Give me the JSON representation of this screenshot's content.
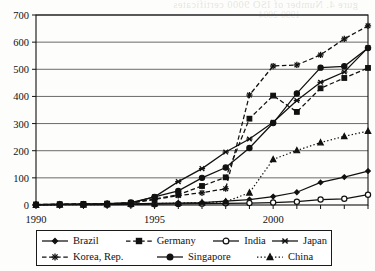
{
  "scan": {
    "bleed_text": "gure 4. Number of ISO 9000 certificates",
    "bleed_text_2": "1990-2004"
  },
  "chart_data": {
    "type": "line",
    "title": "",
    "subtitle": "",
    "xlabel": "",
    "ylabel": "",
    "xlim": [
      1990,
      2004
    ],
    "ylim": [
      0,
      700
    ],
    "ytick_step": 100,
    "yticks": [
      0,
      100,
      200,
      300,
      400,
      500,
      600,
      700
    ],
    "x": [
      1990,
      1991,
      1992,
      1993,
      1994,
      1995,
      1996,
      1997,
      1998,
      1999,
      2000,
      2001,
      2002,
      2003,
      2004
    ],
    "xtick_labels": [
      "1990",
      "1995",
      "2000"
    ],
    "xtick_label_years": [
      1990,
      1995,
      2000
    ],
    "grid": "horizontal",
    "legend_position": "below",
    "series": [
      {
        "name": "Brazil",
        "marker": "diamond",
        "line": "solid",
        "values": [
          1,
          2,
          2,
          3,
          4,
          6,
          7,
          9,
          14,
          20,
          31,
          47,
          83,
          103,
          125
        ]
      },
      {
        "name": "Germany",
        "marker": "square",
        "line": "dashed",
        "values": [
          2,
          3,
          4,
          5,
          8,
          22,
          38,
          70,
          102,
          318,
          403,
          343,
          430,
          468,
          505
        ]
      },
      {
        "name": "India",
        "marker": "circle-open",
        "line": "solid",
        "values": [
          0,
          1,
          1,
          1,
          2,
          3,
          4,
          5,
          6,
          7,
          9,
          12,
          20,
          23,
          38
        ]
      },
      {
        "name": "Japan",
        "marker": "x",
        "line": "solid",
        "values": [
          1,
          2,
          3,
          4,
          7,
          30,
          86,
          134,
          195,
          243,
          305,
          385,
          452,
          490,
          580
        ]
      },
      {
        "name": "Korea, Rep.",
        "marker": "asterisk",
        "line": "dashed",
        "values": [
          1,
          2,
          3,
          4,
          7,
          20,
          35,
          45,
          60,
          405,
          512,
          516,
          553,
          612,
          660
        ]
      },
      {
        "name": "Singapore",
        "marker": "circle-filled",
        "line": "solid",
        "values": [
          1,
          2,
          3,
          5,
          9,
          30,
          52,
          100,
          138,
          210,
          302,
          411,
          506,
          511,
          578
        ]
      },
      {
        "name": "China",
        "marker": "triangle",
        "line": "dotted",
        "values": [
          0,
          1,
          1,
          2,
          3,
          5,
          7,
          9,
          12,
          45,
          168,
          201,
          230,
          253,
          272
        ]
      }
    ]
  },
  "legend": {
    "rows": [
      [
        "Brazil",
        "Germany",
        "India",
        "Japan"
      ],
      [
        "Korea, Rep.",
        "Singapore",
        "China"
      ]
    ]
  }
}
